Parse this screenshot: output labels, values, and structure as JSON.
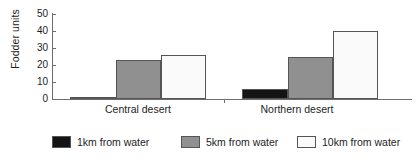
{
  "chart_data": {
    "type": "bar",
    "title": "",
    "xlabel": "",
    "ylabel": "Fodder units",
    "categories": [
      "Central desert",
      "Northern desert"
    ],
    "series": [
      {
        "name": "1km from water",
        "values": [
          1,
          6
        ],
        "color": "#141414"
      },
      {
        "name": "5km from water",
        "values": [
          23,
          25
        ],
        "color": "#909090"
      },
      {
        "name": "10km from water",
        "values": [
          26,
          40
        ],
        "color": "#fafafa"
      }
    ],
    "ylim": [
      0,
      50
    ],
    "yticks": [
      0,
      10,
      20,
      30,
      40,
      50
    ],
    "ytick_labels": [
      "0",
      "10",
      "20",
      "30",
      "40",
      "50"
    ],
    "grid": false,
    "legend_position": "bottom"
  },
  "axis": {
    "y_title": "Fodder units",
    "tick_50": "50",
    "tick_40": "40",
    "tick_30": "30",
    "tick_20": "20",
    "tick_10": "10",
    "tick_0": "0"
  },
  "x_labels": {
    "central": "Central desert",
    "northern": "Northern desert"
  },
  "legend": {
    "item_1": "1km from water",
    "item_2": "5km from water",
    "item_3": "10km from water"
  }
}
